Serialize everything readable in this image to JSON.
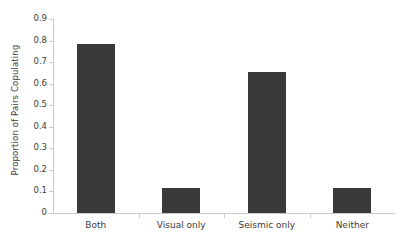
{
  "chart_data": {
    "type": "bar",
    "title": "",
    "xlabel": "",
    "ylabel": "Proportion of Pairs Copulating",
    "categories": [
      "Both",
      "Visual only",
      "Seismic only",
      "Neither"
    ],
    "values": [
      0.785,
      0.118,
      0.655,
      0.118
    ],
    "ylim": [
      0,
      0.9
    ],
    "yticks": [
      0,
      0.1,
      0.2,
      0.3,
      0.4,
      0.5,
      0.6,
      0.7,
      0.8,
      0.9
    ],
    "ytick_labels": [
      "0",
      "0.1",
      "0.2",
      "0.3",
      "0.4",
      "0.5",
      "0.6",
      "0.7",
      "0.8",
      "0.9"
    ],
    "grid": false,
    "legend": null,
    "bar_color": "#3a3a3a",
    "axis_color": "#c9c9c9",
    "text_color": "#3b3b3b",
    "background": "#ffffff"
  }
}
